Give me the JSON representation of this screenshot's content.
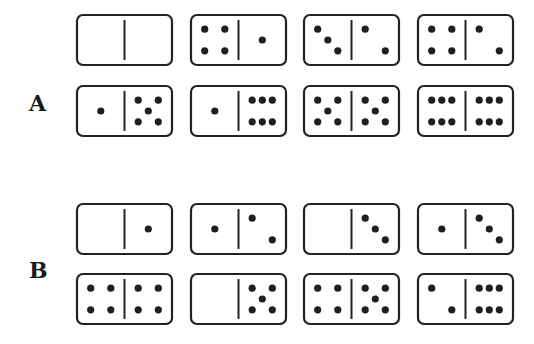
{
  "groups": [
    {
      "label": "A",
      "rows": [
        [
          {
            "left": [],
            "right": []
          },
          {
            "left": [
              [
                0.2,
                0.2
              ],
              [
                0.8,
                0.2
              ],
              [
                0.2,
                0.8
              ],
              [
                0.8,
                0.8
              ]
            ],
            "right": [
              [
                0.5,
                0.5
              ]
            ]
          },
          {
            "left": [
              [
                0.2,
                0.2
              ],
              [
                0.5,
                0.5
              ],
              [
                0.8,
                0.8
              ]
            ],
            "right": [
              [
                0.2,
                0.2
              ],
              [
                0.8,
                0.8
              ]
            ]
          },
          {
            "left": [
              [
                0.2,
                0.2
              ],
              [
                0.8,
                0.2
              ],
              [
                0.2,
                0.8
              ],
              [
                0.8,
                0.8
              ]
            ],
            "right": [
              [
                0.2,
                0.2
              ],
              [
                0.8,
                0.8
              ]
            ]
          }
        ],
        [
          {
            "left": [
              [
                0.5,
                0.5
              ]
            ],
            "right": [
              [
                0.2,
                0.2
              ],
              [
                0.8,
                0.2
              ],
              [
                0.5,
                0.5
              ],
              [
                0.2,
                0.8
              ],
              [
                0.8,
                0.8
              ]
            ]
          },
          {
            "left": [
              [
                0.5,
                0.5
              ]
            ],
            "right": [
              [
                0.2,
                0.2
              ],
              [
                0.5,
                0.2
              ],
              [
                0.8,
                0.2
              ],
              [
                0.2,
                0.8
              ],
              [
                0.5,
                0.8
              ],
              [
                0.8,
                0.8
              ]
            ]
          },
          {
            "left": [
              [
                0.2,
                0.2
              ],
              [
                0.8,
                0.2
              ],
              [
                0.5,
                0.5
              ],
              [
                0.2,
                0.8
              ],
              [
                0.8,
                0.8
              ]
            ],
            "right": [
              [
                0.2,
                0.2
              ],
              [
                0.8,
                0.2
              ],
              [
                0.5,
                0.5
              ],
              [
                0.2,
                0.8
              ],
              [
                0.8,
                0.8
              ]
            ]
          },
          {
            "left": [
              [
                0.2,
                0.2
              ],
              [
                0.5,
                0.2
              ],
              [
                0.8,
                0.2
              ],
              [
                0.2,
                0.8
              ],
              [
                0.5,
                0.8
              ],
              [
                0.8,
                0.8
              ]
            ],
            "right": [
              [
                0.2,
                0.2
              ],
              [
                0.5,
                0.2
              ],
              [
                0.8,
                0.2
              ],
              [
                0.2,
                0.8
              ],
              [
                0.5,
                0.8
              ],
              [
                0.8,
                0.8
              ]
            ]
          }
        ]
      ]
    },
    {
      "label": "B",
      "rows": [
        [
          {
            "left": [],
            "right": [
              [
                0.5,
                0.5
              ]
            ]
          },
          {
            "left": [
              [
                0.5,
                0.5
              ]
            ],
            "right": [
              [
                0.2,
                0.2
              ],
              [
                0.8,
                0.8
              ]
            ]
          },
          {
            "left": [],
            "right": [
              [
                0.2,
                0.2
              ],
              [
                0.5,
                0.5
              ],
              [
                0.8,
                0.8
              ]
            ]
          },
          {
            "left": [
              [
                0.5,
                0.5
              ]
            ],
            "right": [
              [
                0.2,
                0.2
              ],
              [
                0.5,
                0.5
              ],
              [
                0.8,
                0.8
              ]
            ]
          }
        ],
        [
          {
            "left": [
              [
                0.2,
                0.2
              ],
              [
                0.8,
                0.2
              ],
              [
                0.2,
                0.8
              ],
              [
                0.8,
                0.8
              ]
            ],
            "right": [
              [
                0.2,
                0.2
              ],
              [
                0.8,
                0.2
              ],
              [
                0.2,
                0.8
              ],
              [
                0.8,
                0.8
              ]
            ]
          },
          {
            "left": [],
            "right": [
              [
                0.2,
                0.2
              ],
              [
                0.8,
                0.2
              ],
              [
                0.5,
                0.5
              ],
              [
                0.2,
                0.8
              ],
              [
                0.8,
                0.8
              ]
            ]
          },
          {
            "left": [
              [
                0.2,
                0.2
              ],
              [
                0.8,
                0.2
              ],
              [
                0.2,
                0.8
              ],
              [
                0.8,
                0.8
              ]
            ],
            "right": [
              [
                0.2,
                0.2
              ],
              [
                0.8,
                0.2
              ],
              [
                0.5,
                0.5
              ],
              [
                0.2,
                0.8
              ],
              [
                0.8,
                0.8
              ]
            ]
          },
          {
            "left": [
              [
                0.2,
                0.2
              ],
              [
                0.8,
                0.8
              ]
            ],
            "right": [
              [
                0.2,
                0.2
              ],
              [
                0.5,
                0.2
              ],
              [
                0.8,
                0.2
              ],
              [
                0.2,
                0.8
              ],
              [
                0.5,
                0.8
              ],
              [
                0.8,
                0.8
              ]
            ]
          }
        ]
      ]
    }
  ],
  "pip_counts": {
    "A": [
      [
        "0|0",
        "4|1",
        "3|2",
        "4|2"
      ],
      [
        "1|5",
        "1|6",
        "5|5",
        "6|6"
      ]
    ],
    "B": [
      [
        "0|1",
        "1|2",
        "0|3",
        "1|3"
      ],
      [
        "4|4",
        "0|5",
        "4|5",
        "2|6"
      ]
    ]
  },
  "layout": {
    "col_x": [
      77,
      191,
      304,
      418
    ],
    "row_y": [
      15,
      86,
      204,
      274
    ],
    "domino_w": 95,
    "domino_h": 50
  }
}
